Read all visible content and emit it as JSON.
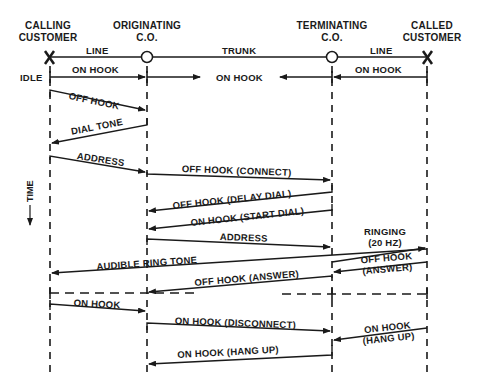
{
  "diagram": {
    "type": "sequence",
    "participants": [
      {
        "id": "calling",
        "label_line1": "CALLING",
        "label_line2": "CUSTOMER",
        "x": 50
      },
      {
        "id": "orig",
        "label_line1": "ORIGINATING",
        "label_line2": "C.O.",
        "x": 147
      },
      {
        "id": "term",
        "label_line1": "TERMINATING",
        "label_line2": "C.O.",
        "x": 332
      },
      {
        "id": "called",
        "label_line1": "CALLED",
        "label_line2": "CUSTOMER",
        "x": 427
      }
    ],
    "segments": {
      "line_left": "LINE",
      "trunk": "TRUNK",
      "line_right": "LINE"
    },
    "state_label": "IDLE",
    "time_axis_label": "TIME",
    "messages": [
      {
        "id": "m1",
        "label": "ON HOOK",
        "from": "calling",
        "to": "orig"
      },
      {
        "id": "m2",
        "label": "ON HOOK",
        "from": "orig",
        "to": "trunk-center"
      },
      {
        "id": "m3",
        "label": "ON HOOK",
        "from": "called",
        "to": "term"
      },
      {
        "id": "m4",
        "label": "OFF HOOK",
        "from": "calling",
        "to": "orig"
      },
      {
        "id": "m5",
        "label": "DIAL TONE",
        "from": "orig",
        "to": "calling"
      },
      {
        "id": "m6",
        "label": "ADDRESS",
        "from": "calling",
        "to": "orig"
      },
      {
        "id": "m7",
        "label": "OFF HOOK (CONNECT)",
        "from": "orig",
        "to": "term"
      },
      {
        "id": "m8",
        "label": "OFF HOOK (DELAY DIAL)",
        "from": "term",
        "to": "orig"
      },
      {
        "id": "m9",
        "label": "ON HOOK (START DIAL)",
        "from": "term",
        "to": "orig"
      },
      {
        "id": "m10",
        "label": "ADDRESS",
        "from": "orig",
        "to": "term"
      },
      {
        "id": "m11a",
        "label": "RINGING",
        "label2": "(20 HZ)",
        "from": "term",
        "to": "called"
      },
      {
        "id": "m12",
        "label": "AUDIBLE RING TONE",
        "from": "term",
        "to": "calling"
      },
      {
        "id": "m13",
        "label": "OFF HOOK",
        "label2": "(ANSWER)",
        "from": "called",
        "to": "term"
      },
      {
        "id": "m14",
        "label": "OFF HOOK (ANSWER)",
        "from": "term",
        "to": "orig"
      },
      {
        "id": "m15",
        "label": "ON HOOK",
        "from": "calling",
        "to": "orig"
      },
      {
        "id": "m16",
        "label": "ON HOOK (DISCONNECT)",
        "from": "orig",
        "to": "term"
      },
      {
        "id": "m17",
        "label": "ON HOOK",
        "label2": "(HANG UP)",
        "from": "called",
        "to": "term"
      },
      {
        "id": "m18",
        "label": "ON HOOK (HANG UP)",
        "from": "term",
        "to": "orig"
      }
    ],
    "colors": {
      "ink": "#1a1a1a",
      "background": "#ffffff"
    }
  }
}
